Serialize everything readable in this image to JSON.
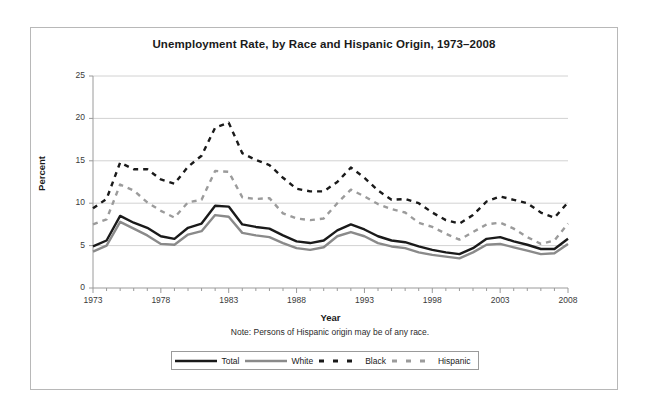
{
  "chart_data": {
    "type": "line",
    "title": "Unemployment Rate, by Race and Hispanic Origin, 1973–2008",
    "xlabel": "Year",
    "ylabel": "Percent",
    "note": "Note: Persons of Hispanic origin may be of any race.",
    "xlim": [
      1973,
      2008
    ],
    "ylim": [
      0,
      25
    ],
    "yticks": [
      0,
      5,
      10,
      15,
      20,
      25
    ],
    "xticks": [
      1973,
      1978,
      1983,
      1988,
      1993,
      1998,
      2003,
      2008
    ],
    "xtick_labels": [
      "1973",
      "1978",
      "1983",
      "1988",
      "1993",
      "1998",
      "2003",
      "2008"
    ],
    "ytick_labels": [
      "0",
      "5",
      "10",
      "15",
      "20",
      "25"
    ],
    "xtick_minor_every": 1,
    "grid": "horizontal",
    "legend_position": "bottom-center",
    "x": [
      1973,
      1974,
      1975,
      1976,
      1977,
      1978,
      1979,
      1980,
      1981,
      1982,
      1983,
      1984,
      1985,
      1986,
      1987,
      1988,
      1989,
      1990,
      1991,
      1992,
      1993,
      1994,
      1995,
      1996,
      1997,
      1998,
      1999,
      2000,
      2001,
      2002,
      2003,
      2004,
      2005,
      2006,
      2007,
      2008
    ],
    "series": [
      {
        "name": "Total",
        "color": "#1a1a1a",
        "style": "solid",
        "width": 2.4,
        "values": [
          4.9,
          5.6,
          8.5,
          7.7,
          7.1,
          6.1,
          5.8,
          7.1,
          7.6,
          9.7,
          9.6,
          7.5,
          7.2,
          7.0,
          6.2,
          5.5,
          5.3,
          5.6,
          6.8,
          7.5,
          6.9,
          6.1,
          5.6,
          5.4,
          4.9,
          4.5,
          4.2,
          4.0,
          4.7,
          5.8,
          6.0,
          5.5,
          5.1,
          4.6,
          4.6,
          5.8
        ]
      },
      {
        "name": "White",
        "color": "#8a8a8a",
        "style": "solid",
        "width": 2.4,
        "values": [
          4.3,
          5.0,
          7.8,
          7.0,
          6.2,
          5.2,
          5.1,
          6.3,
          6.7,
          8.6,
          8.4,
          6.5,
          6.2,
          6.0,
          5.3,
          4.7,
          4.5,
          4.8,
          6.1,
          6.6,
          6.1,
          5.3,
          4.9,
          4.7,
          4.2,
          3.9,
          3.7,
          3.5,
          4.2,
          5.1,
          5.2,
          4.8,
          4.4,
          4.0,
          4.1,
          5.2
        ]
      },
      {
        "name": "Black",
        "color": "#1a1a1a",
        "style": "dashed",
        "width": 2.4,
        "values": [
          9.4,
          10.5,
          14.8,
          14.0,
          14.0,
          12.8,
          12.3,
          14.3,
          15.6,
          18.9,
          19.5,
          15.9,
          15.1,
          14.5,
          13.0,
          11.7,
          11.4,
          11.4,
          12.5,
          14.2,
          13.0,
          11.5,
          10.4,
          10.5,
          10.0,
          8.9,
          8.0,
          7.6,
          8.6,
          10.2,
          10.8,
          10.4,
          10.0,
          8.9,
          8.3,
          10.1
        ]
      },
      {
        "name": "Hispanic",
        "color": "#9b9b9b",
        "style": "dashed",
        "width": 2.4,
        "values": [
          7.5,
          8.1,
          12.2,
          11.5,
          10.1,
          9.1,
          8.3,
          10.1,
          10.4,
          13.8,
          13.7,
          10.7,
          10.5,
          10.6,
          8.8,
          8.2,
          8.0,
          8.2,
          10.0,
          11.6,
          10.8,
          9.9,
          9.3,
          8.9,
          7.7,
          7.2,
          6.4,
          5.7,
          6.6,
          7.5,
          7.7,
          7.0,
          6.0,
          5.2,
          5.6,
          7.6
        ]
      }
    ]
  },
  "legend": {
    "items": [
      {
        "label": "Total",
        "color": "#1a1a1a",
        "style": "solid"
      },
      {
        "label": "White",
        "color": "#8a8a8a",
        "style": "solid"
      },
      {
        "label": "Black",
        "color": "#1a1a1a",
        "style": "dashed"
      },
      {
        "label": "Hispanic",
        "color": "#9b9b9b",
        "style": "dashed"
      }
    ]
  }
}
